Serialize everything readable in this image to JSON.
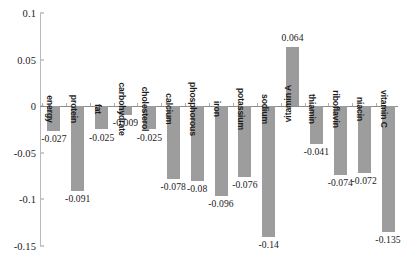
{
  "chart_data": {
    "type": "bar",
    "title": "",
    "subtitle": "",
    "xlabel": "",
    "ylabel": "",
    "ylim": [
      -0.15,
      0.1
    ],
    "yticks": [
      0.1,
      0.05,
      0,
      -0.05,
      -0.1,
      -0.15
    ],
    "ytick_labels": [
      "0.1",
      "0.05",
      "0",
      "-0.05",
      "-0.1",
      "-0.15"
    ],
    "grid": false,
    "legend": null,
    "bar_color": "#9d9d9d",
    "axis_color": "#8d8d8d",
    "categories": [
      "energy",
      "protein",
      "fat",
      "carbohydrate",
      "cholesterol",
      "calcium",
      "phosphorous",
      "iron",
      "potassium",
      "sodium",
      "vitamin A",
      "thiamin",
      "riboflavin",
      "niacin",
      "vitamin C"
    ],
    "values": [
      -0.027,
      -0.091,
      -0.025,
      -0.009,
      -0.025,
      -0.078,
      -0.08,
      -0.096,
      -0.076,
      -0.14,
      0.064,
      -0.041,
      -0.074,
      -0.072,
      -0.135
    ],
    "value_labels": [
      "-0.027",
      "-0.091",
      "-0.025",
      "-0.009",
      "-0.025",
      "-0.078",
      "-0.08",
      "-0.096",
      "-0.076",
      "-0.14",
      "0.064",
      "-0.041",
      "-0.074",
      "-0.072",
      "-0.135"
    ]
  }
}
